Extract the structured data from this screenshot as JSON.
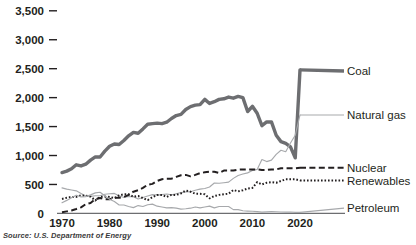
{
  "source_note": "Source: U.S. Department of Energy",
  "chart_data": {
    "type": "line",
    "title": "",
    "xlabel": "",
    "ylabel": "",
    "xlim": [
      1970,
      2021
    ],
    "ylim": [
      0,
      3500
    ],
    "grid": false,
    "legend_position": "right-inline",
    "yticks": [
      "3,500",
      "3,000",
      "2,500",
      "2,000",
      "1,500",
      "1,000",
      "500",
      "0"
    ],
    "ytick_values": [
      3500,
      3000,
      2500,
      2000,
      1500,
      1000,
      500,
      0
    ],
    "xticks": [
      "1970",
      "1980",
      "1990",
      "2000",
      "2010",
      "2020"
    ],
    "xtick_values": [
      1970,
      1980,
      1990,
      2000,
      2010,
      2020
    ],
    "x": [
      1970,
      1971,
      1972,
      1973,
      1974,
      1975,
      1976,
      1977,
      1978,
      1979,
      1980,
      1981,
      1982,
      1983,
      1984,
      1985,
      1986,
      1987,
      1988,
      1989,
      1990,
      1991,
      1992,
      1993,
      1994,
      1995,
      1996,
      1997,
      1998,
      1999,
      2000,
      2001,
      2002,
      2003,
      2004,
      2005,
      2006,
      2007,
      2008,
      2009,
      2010,
      2011,
      2012,
      2013,
      2014,
      2015,
      2016,
      2017,
      2018,
      2019,
      2020
    ],
    "series": [
      {
        "name": "Coal",
        "style": "solid-thick",
        "color": "#6d6e71",
        "label_x": 2021,
        "label_y": 2460,
        "values": [
          705,
          730,
          770,
          840,
          820,
          850,
          920,
          975,
          975,
          1075,
          1160,
          1200,
          1190,
          1260,
          1340,
          1400,
          1385,
          1460,
          1540,
          1550,
          1560,
          1550,
          1575,
          1640,
          1690,
          1710,
          1795,
          1845,
          1870,
          1880,
          1970,
          1900,
          1930,
          1970,
          1980,
          2010,
          1990,
          2020,
          2000,
          1760,
          1850,
          1730,
          1515,
          1580,
          1580,
          1350,
          1240,
          1210,
          1150,
          960,
          2480
        ]
      },
      {
        "name": "Natural gas",
        "style": "solid-thin",
        "color": "#a7a9ac",
        "label_x": 2021,
        "label_y": 1700,
        "values": [
          440,
          420,
          405,
          390,
          345,
          300,
          295,
          305,
          305,
          330,
          340,
          345,
          305,
          275,
          295,
          290,
          250,
          275,
          300,
          325,
          315,
          325,
          335,
          320,
          340,
          360,
          370,
          375,
          400,
          420,
          430,
          455,
          525,
          520,
          530,
          540,
          605,
          655,
          680,
          700,
          740,
          760,
          930,
          895,
          920,
          1020,
          1090,
          1065,
          1215,
          1350,
          1700
        ]
      },
      {
        "name": "Nuclear",
        "style": "dashed",
        "color": "#231f20",
        "label_x": 2021,
        "label_y": 790,
        "values": [
          20,
          35,
          50,
          75,
          105,
          160,
          180,
          245,
          265,
          245,
          245,
          270,
          270,
          285,
          320,
          375,
          400,
          440,
          495,
          510,
          560,
          590,
          600,
          600,
          630,
          660,
          665,
          640,
          665,
          695,
          710,
          720,
          720,
          700,
          740,
          740,
          740,
          755,
          760,
          760,
          760,
          760,
          750,
          750,
          760,
          760,
          780,
          780,
          780,
          780,
          790
        ]
      },
      {
        "name": "Renewables",
        "style": "dotted",
        "color": "#231f20",
        "label_x": 2021,
        "label_y": 570,
        "values": [
          250,
          270,
          285,
          285,
          310,
          305,
          290,
          225,
          285,
          290,
          285,
          265,
          310,
          330,
          330,
          290,
          300,
          265,
          230,
          280,
          320,
          320,
          285,
          320,
          320,
          345,
          395,
          375,
          340,
          340,
          330,
          260,
          300,
          320,
          330,
          340,
          405,
          380,
          400,
          430,
          440,
          540,
          500,
          530,
          540,
          530,
          560,
          590,
          590,
          590,
          570
        ]
      },
      {
        "name": "Petroleum",
        "style": "solid-thin",
        "color": "#a7a9ac",
        "label_x": 2021,
        "label_y": 90,
        "values": [
          185,
          225,
          270,
          315,
          285,
          290,
          320,
          355,
          365,
          305,
          245,
          205,
          145,
          145,
          120,
          100,
          135,
          120,
          150,
          160,
          125,
          110,
          95,
          100,
          90,
          75,
          80,
          90,
          110,
          95,
          110,
          125,
          95,
          120,
          120,
          120,
          65,
          65,
          45,
          40,
          37,
          30,
          23,
          27,
          30,
          28,
          24,
          21,
          25,
          18,
          17
        ]
      }
    ]
  },
  "labels": {
    "coal": "Coal",
    "natural_gas": "Natural gas",
    "nuclear": "Nuclear",
    "renewables": "Renewables",
    "petroleum": "Petroleum"
  }
}
